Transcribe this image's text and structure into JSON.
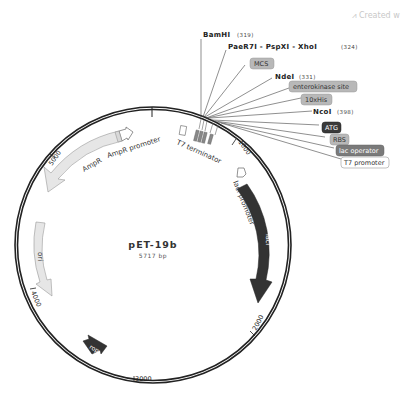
{
  "credit": {
    "icon": "snapgene-icon",
    "text": "Created w"
  },
  "plasmid": {
    "name": "pET-19b",
    "size_label": "5717 bp",
    "length_bp": 5717
  },
  "ticks": [
    {
      "label": "1000",
      "bp": 1000
    },
    {
      "label": "2000",
      "bp": 2000
    },
    {
      "label": "3000",
      "bp": 3000
    },
    {
      "label": "4000",
      "bp": 4000
    },
    {
      "label": "5000",
      "bp": 5000
    }
  ],
  "sites": [
    {
      "name": "BamHI",
      "pos": "(319)"
    },
    {
      "name": "PaeR7I - PspXI - XhoI",
      "pos": "(324)"
    },
    {
      "name": "NdeI",
      "pos": "(331)"
    },
    {
      "name": "NcoI",
      "pos": "(398)"
    }
  ],
  "feature_boxes": [
    {
      "label": "MCS",
      "style": "mid"
    },
    {
      "label": "enterokinase site",
      "style": "mid"
    },
    {
      "label": "10xHis",
      "style": "mid"
    },
    {
      "label": "ATG",
      "style": "dark"
    },
    {
      "label": "RBS",
      "style": "mid"
    },
    {
      "label": "lac operator",
      "style": "darkmid"
    },
    {
      "label": "T7 promoter",
      "style": "white"
    }
  ],
  "features": {
    "ampr": "AmpR",
    "ampr_promoter": "AmpR promoter",
    "ori": "ori",
    "rop": "rop",
    "laci": "lacI",
    "laci_promoter": "lacI promoter",
    "t7_terminator": "T7 terminator"
  },
  "colors": {
    "backbone": "#222222",
    "ampr_fill": "#e6e6e6",
    "laci_fill": "#333333",
    "rop_fill": "#333333",
    "box_mid": "#b8b8b8",
    "box_dark": "#3a3a3a",
    "box_darkmid": "#7a7a7a"
  }
}
